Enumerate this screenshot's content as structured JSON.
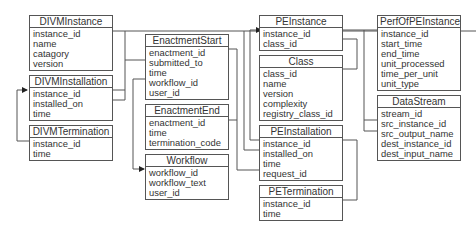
{
  "diagram": {
    "type": "entity-relationship schema",
    "entities": [
      {
        "id": "DIVMInstance",
        "title": "DIVMInstance",
        "fields": [
          "instance_id",
          "name",
          "catagory",
          "version"
        ]
      },
      {
        "id": "DIVMInstallation",
        "title": "DIVMInstallation",
        "fields": [
          "instance_id",
          "installed_on",
          "time"
        ]
      },
      {
        "id": "DIVMTermination",
        "title": "DIVMTermination",
        "fields": [
          "instance_id",
          "time"
        ]
      },
      {
        "id": "EnactmentStart",
        "title": "EnactmentStart",
        "fields": [
          "enactment_id",
          "submitted_to",
          "time",
          "workflow_id",
          "user_id"
        ]
      },
      {
        "id": "EnactmentEnd",
        "title": "EnactmentEnd",
        "fields": [
          "enactment_id",
          "time",
          "termination_code"
        ]
      },
      {
        "id": "Workflow",
        "title": "Workflow",
        "fields": [
          "workflow_id",
          "workflow_text",
          "user_id"
        ]
      },
      {
        "id": "PEInstance",
        "title": "PEInstance",
        "fields": [
          "instance_id",
          "class_id"
        ]
      },
      {
        "id": "Class",
        "title": "Class",
        "fields": [
          "class_id",
          "name",
          "version",
          "complexity",
          "registry_class_id"
        ]
      },
      {
        "id": "PEInstallation",
        "title": "PEInstallation",
        "fields": [
          "instance_id",
          "installed_on",
          "time",
          "request_id"
        ]
      },
      {
        "id": "PETermination",
        "title": "PETermination",
        "fields": [
          "instance_id",
          "time"
        ]
      },
      {
        "id": "PerfOfPEInstance",
        "title": "PerfOfPEInstance",
        "fields": [
          "instance_id",
          "start_time",
          "end_time",
          "unit_processed",
          "time_per_unit",
          "unit_type"
        ]
      },
      {
        "id": "DataStream",
        "title": "DataStream",
        "fields": [
          "stream_id",
          "src_instance_id",
          "src_output_name",
          "dest_instance_id",
          "dest_input_name"
        ]
      }
    ],
    "relationships": [
      {
        "from": "DIVMInstallation.instance_id",
        "to": "DIVMInstance.instance_id"
      },
      {
        "from": "EnactmentStart.submitted_to",
        "to": "DIVMInstance.instance_id"
      },
      {
        "from": "DIVMTermination.instance_id",
        "to": "DIVMInstallation.instance_id"
      },
      {
        "from": "EnactmentStart.workflow_id",
        "to": "Workflow.workflow_id"
      },
      {
        "from": "EnactmentEnd.enactment_id",
        "to": "EnactmentStart.enactment_id"
      },
      {
        "from": "PEInstance.class_id",
        "to": "Class.class_id"
      },
      {
        "from": "PerfOfPEInstance.instance_id",
        "to": "PEInstance.instance_id"
      },
      {
        "from": "DataStream.src_instance_id",
        "to": "PEInstance.instance_id"
      },
      {
        "from": "DataStream.dest_instance_id",
        "to": "PEInstance.instance_id"
      },
      {
        "from": "PEInstallation.instance_id",
        "to": "PEInstance.instance_id"
      },
      {
        "from": "PEInstallation.installed_on",
        "to": "DIVMInstance.instance_id"
      },
      {
        "from": "PEInstallation.request_id",
        "to": "EnactmentStart.enactment_id"
      },
      {
        "from": "PETermination.instance_id",
        "to": "PEInstallation.instance_id"
      }
    ]
  }
}
